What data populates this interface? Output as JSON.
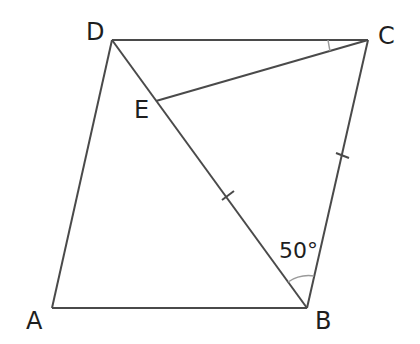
{
  "diagram": {
    "type": "parallelogram-geometry",
    "points": {
      "A": {
        "label": "A",
        "x": 52,
        "y": 308
      },
      "B": {
        "label": "B",
        "x": 307,
        "y": 308
      },
      "C": {
        "label": "C",
        "x": 368,
        "y": 40
      },
      "D": {
        "label": "D",
        "x": 112,
        "y": 40
      },
      "E": {
        "label": "E",
        "x": 156,
        "y": 101
      }
    },
    "segments": [
      "AB",
      "BC",
      "CD",
      "DA",
      "DB",
      "CE"
    ],
    "equal_marks": [
      "EB",
      "BC"
    ],
    "angles": [
      {
        "vertex": "B",
        "label": "50°",
        "between": [
          "D",
          "C"
        ]
      },
      {
        "vertex": "C",
        "label": "",
        "between": [
          "D",
          "E"
        ]
      }
    ],
    "colors": {
      "line": "#4a4a4a",
      "arc": "#9a9a9a",
      "text": "#1e1e1e"
    }
  }
}
